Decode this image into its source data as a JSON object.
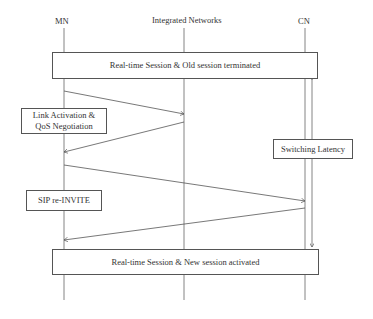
{
  "participants": [
    {
      "id": "mn",
      "label": "MN"
    },
    {
      "id": "integrated-networks",
      "label": "Integrated Networks"
    },
    {
      "id": "cn",
      "label": "CN"
    }
  ],
  "boxes": {
    "top": "Real-time Session & Old session terminated",
    "link_activation_line1": "Link Activation &",
    "link_activation_line2": "QoS Negotiation",
    "switching_latency": "Switching Latency",
    "sip_reinvite": "SIP re-INVITE",
    "bottom": "Real-time Session & New session activated"
  },
  "messages": [
    {
      "from": "MN",
      "to": "Integrated Networks",
      "phase": "Link Activation & QoS Negotiation"
    },
    {
      "from": "Integrated Networks",
      "to": "MN",
      "phase": "Link Activation & QoS Negotiation"
    },
    {
      "from": "MN",
      "to": "CN",
      "phase": "SIP re-INVITE"
    },
    {
      "from": "CN",
      "to": "MN",
      "phase": "SIP re-INVITE"
    }
  ],
  "colors": {
    "line": "#555555",
    "text": "#333333"
  }
}
